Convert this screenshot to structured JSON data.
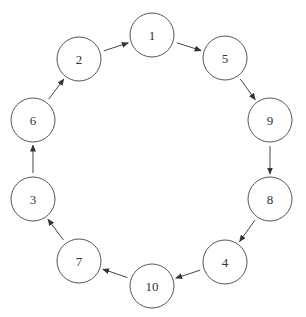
{
  "diagram": {
    "type": "directed-cycle",
    "node_radius": 22,
    "stroke_color": "#555555",
    "background": "#ffffff",
    "nodes": [
      {
        "id": "1",
        "label": "1",
        "x": 152,
        "y": 35
      },
      {
        "id": "5",
        "label": "5",
        "x": 225,
        "y": 58
      },
      {
        "id": "9",
        "label": "9",
        "x": 270,
        "y": 120
      },
      {
        "id": "8",
        "label": "8",
        "x": 270,
        "y": 199
      },
      {
        "id": "4",
        "label": "4",
        "x": 225,
        "y": 262
      },
      {
        "id": "10",
        "label": "10",
        "x": 152,
        "y": 286
      },
      {
        "id": "7",
        "label": "7",
        "x": 79,
        "y": 261
      },
      {
        "id": "3",
        "label": "3",
        "x": 33,
        "y": 199
      },
      {
        "id": "6",
        "label": "6",
        "x": 33,
        "y": 120
      },
      {
        "id": "2",
        "label": "2",
        "x": 79,
        "y": 59
      }
    ],
    "edges": [
      {
        "from": "1",
        "to": "5"
      },
      {
        "from": "5",
        "to": "9"
      },
      {
        "from": "9",
        "to": "8"
      },
      {
        "from": "8",
        "to": "4"
      },
      {
        "from": "4",
        "to": "10"
      },
      {
        "from": "10",
        "to": "7"
      },
      {
        "from": "7",
        "to": "3"
      },
      {
        "from": "3",
        "to": "6"
      },
      {
        "from": "6",
        "to": "2"
      },
      {
        "from": "2",
        "to": "1"
      }
    ]
  }
}
